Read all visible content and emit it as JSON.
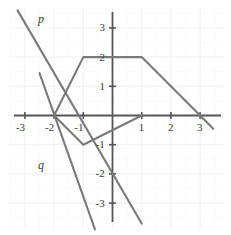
{
  "chart_data": {
    "type": "line",
    "title": "",
    "xlabel": "",
    "ylabel": "",
    "xlim": [
      -3.6,
      4.0
    ],
    "ylim": [
      -3.6,
      3.6
    ],
    "grid": true,
    "grid_color": "#f2f2f2",
    "axis_color": "#555555",
    "curve_color": "#7a7a7a",
    "background": "#ffffff",
    "xticks": [
      -3,
      -2,
      -1,
      1,
      2,
      3
    ],
    "yticks": [
      -3,
      -2,
      -1,
      1,
      2,
      3
    ],
    "xtick_labels": [
      "-3",
      "-2",
      "-1",
      "1",
      "2",
      "3"
    ],
    "ytick_labels": [
      "-3",
      "-2",
      "-1",
      "1",
      "2",
      "3"
    ],
    "legend_position": "inline-labels",
    "series": [
      {
        "name": "p",
        "label": "p",
        "label_x": -2.55,
        "label_y": 3.3,
        "points": [
          [
            -3.25,
            3.6
          ],
          [
            1.0,
            -3.7
          ]
        ]
      },
      {
        "name": "q",
        "label": "q",
        "label_x": -2.55,
        "label_y": -1.7,
        "points": [
          [
            -2.5,
            1.45
          ],
          [
            -0.6,
            -3.9
          ]
        ]
      },
      {
        "name": "upper-piecewise",
        "label": "",
        "points": [
          [
            -2.0,
            0.0
          ],
          [
            -1.0,
            2.0
          ],
          [
            1.0,
            2.0
          ],
          [
            3.0,
            0.0
          ],
          [
            3.45,
            -0.45
          ]
        ]
      },
      {
        "name": "lower-piecewise",
        "label": "",
        "points": [
          [
            -2.0,
            0.0
          ],
          [
            -1.0,
            -1.0
          ],
          [
            1.0,
            0.0
          ]
        ]
      }
    ],
    "annotations": [
      {
        "name": "p",
        "text": "p",
        "x": -2.55,
        "y": 3.3
      },
      {
        "name": "q",
        "text": "q",
        "x": -2.55,
        "y": -1.7
      }
    ]
  }
}
